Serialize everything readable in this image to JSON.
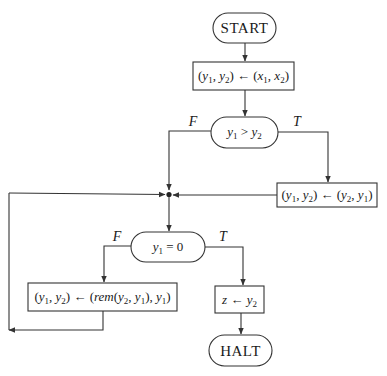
{
  "diagram": {
    "type": "flowchart",
    "colors": {
      "stroke": "#333333",
      "text": "#1a1a1a",
      "background": "#ffffff"
    },
    "nodes": {
      "start": {
        "kind": "terminal",
        "label": "START"
      },
      "init": {
        "kind": "process",
        "label": "(y1, y2) ← (x1, x2)",
        "lhs": "(y1, y2)",
        "arrow": "←",
        "rhs": "(x1, x2)"
      },
      "test_gt": {
        "kind": "decision",
        "label": "y1 > y2",
        "op": ">"
      },
      "swap": {
        "kind": "process",
        "label": "(y1, y2) ← (y2, y1)",
        "lhs": "(y1, y2)",
        "arrow": "←",
        "rhs": "(y2, y1)"
      },
      "test_zero": {
        "kind": "decision",
        "label": "y1 = 0",
        "op": "=",
        "rhs": "0"
      },
      "rem": {
        "kind": "process",
        "label": "(y1, y2) ← (rem(y2, y1), y1)",
        "lhs": "(y1, y2)",
        "arrow": "←",
        "fn": "rem"
      },
      "assign_z": {
        "kind": "process",
        "label": "z ← y2",
        "var": "z",
        "arrow": "←"
      },
      "halt": {
        "kind": "terminal",
        "label": "HALT"
      }
    },
    "edge_labels": {
      "gt_false": "F",
      "gt_true": "T",
      "zero_false": "F",
      "zero_true": "T"
    },
    "edges": [
      {
        "from": "start",
        "to": "init"
      },
      {
        "from": "init",
        "to": "test_gt"
      },
      {
        "from": "test_gt",
        "to": "junction",
        "label": "F"
      },
      {
        "from": "test_gt",
        "to": "swap",
        "label": "T"
      },
      {
        "from": "swap",
        "to": "junction"
      },
      {
        "from": "junction",
        "to": "test_zero"
      },
      {
        "from": "test_zero",
        "to": "rem",
        "label": "F"
      },
      {
        "from": "test_zero",
        "to": "assign_z",
        "label": "T"
      },
      {
        "from": "rem",
        "to": "junction",
        "note": "loop back"
      },
      {
        "from": "assign_z",
        "to": "halt"
      }
    ]
  }
}
